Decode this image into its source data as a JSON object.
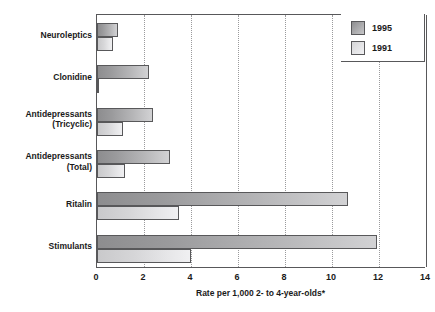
{
  "chart": {
    "type": "bar",
    "orientation": "horizontal",
    "xlabel": "Rate per 1,000 2- to 4-year-olds*",
    "legend_position": "top-right"
  },
  "legend": {
    "items": [
      {
        "label": "1995",
        "swatch": "swatch-1995",
        "color": "#a8a8aa"
      },
      {
        "label": "1991",
        "swatch": "swatch-1991",
        "color": "#e2e2e4"
      }
    ]
  },
  "xaxis": {
    "min": 0,
    "max": 14,
    "step": 2,
    "ticks": [
      "0",
      "2",
      "4",
      "6",
      "8",
      "10",
      "12",
      "14"
    ]
  },
  "categories": [
    {
      "line1": "Neuroleptics",
      "line2": ""
    },
    {
      "line1": "Clonidine",
      "line2": ""
    },
    {
      "line1": "Antidepressants",
      "line2": "(Tricyclic)"
    },
    {
      "line1": "Antidepressants",
      "line2": "(Total)"
    },
    {
      "line1": "Ritalin",
      "line2": ""
    },
    {
      "line1": "Stimulants",
      "line2": ""
    }
  ],
  "chart_data": {
    "type": "bar",
    "orientation": "horizontal",
    "title": "",
    "subtitle": "",
    "xlabel": "Rate per 1,000 2- to 4-year-olds*",
    "ylabel": "",
    "xlim": [
      0,
      14
    ],
    "xticks": [
      0,
      2,
      4,
      6,
      8,
      10,
      12,
      14
    ],
    "grid": "vertical-dotted",
    "legend": [
      "1995",
      "1991"
    ],
    "legend_position": "top-right",
    "categories": [
      "Neuroleptics",
      "Clonidine",
      "Antidepressants (Tricyclic)",
      "Antidepressants (Total)",
      "Ritalin",
      "Stimulants"
    ],
    "series": [
      {
        "name": "1995",
        "values": [
          0.9,
          2.2,
          2.4,
          3.1,
          10.7,
          11.9
        ]
      },
      {
        "name": "1991",
        "values": [
          0.7,
          0.1,
          1.1,
          1.2,
          3.5,
          4.0
        ]
      }
    ]
  }
}
